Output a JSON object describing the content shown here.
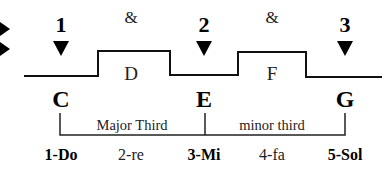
{
  "diagram": {
    "type": "rhythm-and-interval diagram",
    "colors": {
      "ink": "#000000",
      "background": "#ffffff"
    },
    "side_markers": [
      "arrow-right-icon",
      "arrow-right-icon"
    ],
    "beats": [
      {
        "label": "1",
        "x": 61
      },
      {
        "label": "2",
        "x": 204
      },
      {
        "label": "3",
        "x": 345
      }
    ],
    "offbeats": [
      {
        "label": "&",
        "x": 131
      },
      {
        "label": "&",
        "x": 272
      }
    ],
    "waveform_notes": [
      {
        "label": "D",
        "x": 131
      },
      {
        "label": "F",
        "x": 272
      }
    ],
    "chord_notes": [
      {
        "label": "C",
        "x": 61
      },
      {
        "label": "E",
        "x": 204
      },
      {
        "label": "G",
        "x": 345
      }
    ],
    "intervals": [
      {
        "label": "Major Third",
        "x": 132
      },
      {
        "label": "minor third",
        "x": 272
      }
    ],
    "solfege": [
      {
        "label": "1-Do",
        "x": 61,
        "bold": true
      },
      {
        "label": "2-re",
        "x": 131,
        "bold": false
      },
      {
        "label": "3-Mi",
        "x": 204,
        "bold": true
      },
      {
        "label": "4-fa",
        "x": 272,
        "bold": false
      },
      {
        "label": "5-Sol",
        "x": 345,
        "bold": true
      }
    ]
  }
}
